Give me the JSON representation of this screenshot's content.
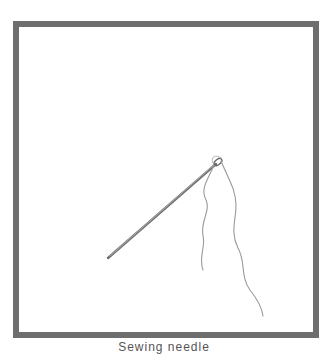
{
  "illustration": {
    "subject": "needle-and-thread",
    "frame_color": "#6e6e6e",
    "needle_color": "#7a7a7a",
    "thread_color": "#9a9a9a"
  },
  "caption": {
    "text": "Sewing needle"
  }
}
